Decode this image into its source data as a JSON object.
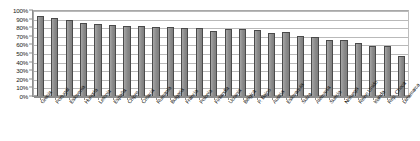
{
  "chart_data": {
    "type": "bar",
    "title": "",
    "xlabel": "",
    "ylabel": "",
    "ylim": [
      0,
      100
    ],
    "grid": true,
    "legend": false,
    "value_suffix": "%",
    "y_ticks": [
      "0%",
      "10%",
      "20%",
      "30%",
      "40%",
      "50%",
      "60%",
      "70%",
      "80%",
      "90%",
      "100%"
    ],
    "y_tick_values": [
      0,
      10,
      20,
      30,
      40,
      50,
      60,
      70,
      80,
      90,
      100
    ],
    "categories": [
      "Grecia",
      "Portugal",
      "Eslovenia",
      "Hungría",
      "Letonia",
      "España",
      "Chipre",
      "Croacia",
      "Rumanía",
      "Bulgaria",
      "Francia",
      "Polonia",
      "Finlandia",
      "Ucrania",
      "Bélgica",
      "P. Bajos",
      "Austria",
      "Eslovaquia",
      "Suiza",
      "Alemania",
      "Suecia",
      "Noruega",
      "Reino Unido",
      "Irlanda",
      "Rep. Checa",
      "Dinamarca"
    ],
    "values": [
      93,
      91,
      88,
      85,
      84,
      83,
      81,
      81,
      80,
      80,
      79,
      79,
      76,
      78,
      78,
      77,
      73,
      74,
      70,
      69,
      65,
      65,
      62,
      58,
      58,
      46
    ]
  },
  "axes": {
    "y_max_label": "100%",
    "y_min_label": "0%"
  },
  "colors": {
    "bar_fill": "#8f8f8f",
    "bar_stroke": "#4a4a4a",
    "gridline": "#b9b9b9",
    "axis": "#8d8d8d",
    "text": "#111111",
    "background": "#ffffff"
  }
}
